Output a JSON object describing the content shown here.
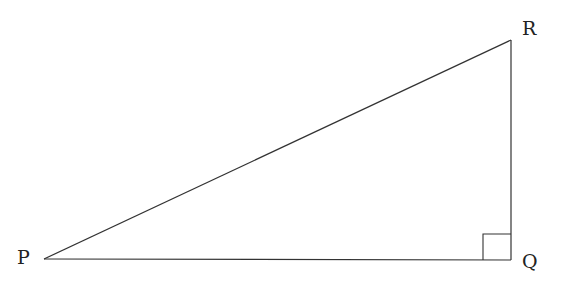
{
  "diagram": {
    "type": "right-triangle",
    "stroke_color": "#333333",
    "background": "#ffffff",
    "vertices": [
      {
        "id": "P",
        "label": "P",
        "x": 44,
        "y": 259,
        "label_x": 17,
        "label_y": 264
      },
      {
        "id": "Q",
        "label": "Q",
        "x": 511,
        "y": 260,
        "label_x": 522,
        "label_y": 268
      },
      {
        "id": "R",
        "label": "R",
        "x": 511,
        "y": 40,
        "label_x": 522,
        "label_y": 35
      }
    ],
    "edges": [
      {
        "from": "P",
        "to": "Q"
      },
      {
        "from": "Q",
        "to": "R"
      },
      {
        "from": "P",
        "to": "R"
      }
    ],
    "right_angle_at": "Q",
    "right_angle_marker_size": 28
  }
}
